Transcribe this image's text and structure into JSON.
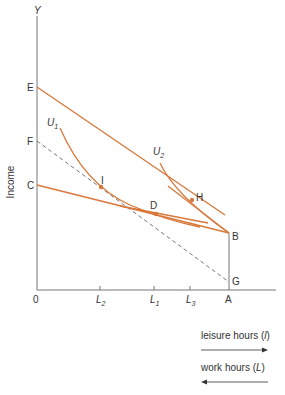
{
  "diagram": {
    "title": "",
    "y_axis": {
      "label": "Income",
      "top_label": "Y"
    },
    "origin_label": "0",
    "vertical_points": [
      {
        "id": "E",
        "label": "E"
      },
      {
        "id": "F",
        "label": "F"
      },
      {
        "id": "C",
        "label": "C"
      }
    ],
    "x_ticks": [
      {
        "label": "L",
        "sub": "2"
      },
      {
        "label": "L",
        "sub": "1"
      },
      {
        "label": "L",
        "sub": "3"
      },
      {
        "label": "A",
        "sub": ""
      }
    ],
    "points": [
      {
        "id": "I",
        "label": "I"
      },
      {
        "id": "D",
        "label": "D"
      },
      {
        "id": "H",
        "label": "H"
      },
      {
        "id": "B",
        "label": "B"
      },
      {
        "id": "G",
        "label": "G"
      }
    ],
    "curves": [
      {
        "id": "U1",
        "label": "U",
        "sub": "1"
      },
      {
        "id": "U2",
        "label": "U",
        "sub": "2"
      }
    ],
    "legend": {
      "leisure": "leisure hours (",
      "leisure_var": "l",
      "leisure_end": ")",
      "work": "work hours (",
      "work_var": "L",
      "work_end": ")"
    },
    "colors": {
      "curve": "#d9773a",
      "axis": "#666666",
      "dashed": "#555555",
      "text": "#333333"
    }
  }
}
